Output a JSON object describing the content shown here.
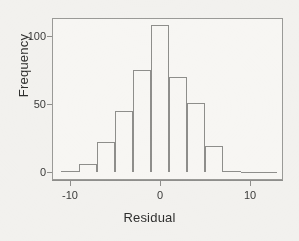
{
  "chart_data": {
    "type": "bar",
    "title": "",
    "subtitle": "",
    "xlabel": "Residual",
    "ylabel": "Frequency",
    "xlim": [
      -11,
      14
    ],
    "ylim": [
      0,
      112
    ],
    "grid": false,
    "legend": null,
    "bin_width": 2,
    "x_ticks": [
      -10,
      0,
      10
    ],
    "x_tick_labels": [
      "-10",
      "0",
      "10"
    ],
    "y_ticks": [
      0,
      50,
      100
    ],
    "y_tick_labels": [
      "0",
      "50",
      "100"
    ],
    "bin_edges": [
      -11,
      -9,
      -7,
      -5,
      -3,
      -1,
      1,
      3,
      5,
      7,
      9,
      11,
      13
    ],
    "bin_centers": [
      -10,
      -8,
      -6,
      -4,
      -2,
      0,
      2,
      4,
      6,
      8,
      10,
      12
    ],
    "values": [
      1,
      6,
      22,
      45,
      75,
      108,
      70,
      51,
      19,
      1,
      0,
      0
    ],
    "categories": [
      "-11 to -9",
      "-9 to -7",
      "-7 to -5",
      "-5 to -3",
      "-3 to -1",
      "-1 to 1",
      "1 to 3",
      "3 to 5",
      "5 to 7",
      "7 to 9",
      "9 to 11",
      "11 to 13"
    ],
    "series": [
      {
        "name": "Frequency",
        "values": [
          1,
          6,
          22,
          45,
          75,
          108,
          70,
          51,
          19,
          1,
          0,
          0
        ]
      }
    ],
    "colors": {
      "bar_outline": "#8e8e8b",
      "bar_fill": "transparent",
      "axis": "#8e8e8b",
      "text": "#2f2f2e",
      "background": "#f2f1ee",
      "plot_background": "#f7f6f3"
    }
  },
  "axes": {
    "y_ticks": [
      {
        "label": "100",
        "value": 100
      },
      {
        "label": "50",
        "value": 50
      },
      {
        "label": "0",
        "value": 0
      }
    ],
    "x_ticks": [
      {
        "label": "-10",
        "value": -10
      },
      {
        "label": "0",
        "value": 0
      },
      {
        "label": "10",
        "value": 10
      }
    ],
    "xlabel": "Residual",
    "ylabel": "Frequency"
  }
}
